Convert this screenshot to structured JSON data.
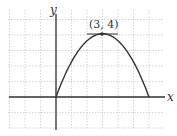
{
  "chart_data": {
    "type": "line",
    "title": "",
    "xlabel": "x",
    "ylabel": "y",
    "xlim": [
      -3,
      7
    ],
    "ylim": [
      -2,
      6
    ],
    "grid": true,
    "series": [
      {
        "name": "parabola",
        "x": [
          0,
          0.5,
          1,
          1.5,
          2,
          2.5,
          3,
          3.5,
          4,
          4.5,
          5,
          5.5,
          6
        ],
        "y": [
          0,
          1.75,
          3.333,
          3.556,
          3.556,
          3.889,
          4,
          3.889,
          3.556,
          3,
          2.222,
          1.222,
          0
        ]
      }
    ],
    "equation": "y = -4/9 (x - 3)^2 + 4",
    "annotations": [
      {
        "text": "(3, 4)",
        "x": 3,
        "y": 4
      }
    ]
  },
  "labels": {
    "x_axis": "x",
    "y_axis": "y",
    "vertex": "(3, 4)"
  }
}
